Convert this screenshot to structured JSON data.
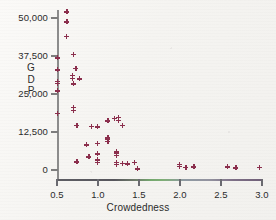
{
  "chart_data": {
    "type": "scatter",
    "title": "",
    "xlabel": "Crowdedness",
    "ylabel": "GDP",
    "ylabel_stacked": [
      "G",
      "D",
      "P"
    ],
    "xlim": [
      0.5,
      3.0
    ],
    "ylim": [
      0,
      50000
    ],
    "grid": false,
    "legend": null,
    "xticks": [
      0.5,
      1.0,
      1.5,
      2.0,
      2.5,
      3.0
    ],
    "xtick_labels": [
      "0.5",
      "1.0",
      "1.5",
      "2.0",
      "2.5",
      "3.0"
    ],
    "yticks": [
      0,
      12500,
      25000,
      37500,
      50000
    ],
    "ytick_labels": [
      "0",
      "12,500",
      "25,000",
      "37,500",
      "50,000"
    ],
    "marker": "plus",
    "marker_color": "#8b2f4d",
    "axis_color": "#8c8c8c",
    "background_color": "#f7f6f3",
    "points": [
      [
        0.62,
        52000
      ],
      [
        0.62,
        48800
      ],
      [
        0.61,
        44000
      ],
      [
        0.7,
        38000
      ],
      [
        0.5,
        36900
      ],
      [
        0.73,
        33400
      ],
      [
        0.5,
        33000
      ],
      [
        0.69,
        31200
      ],
      [
        0.69,
        30200
      ],
      [
        0.77,
        30000
      ],
      [
        0.5,
        29100
      ],
      [
        0.5,
        28600
      ],
      [
        0.7,
        28300
      ],
      [
        0.5,
        26100
      ],
      [
        0.7,
        20600
      ],
      [
        0.7,
        19700
      ],
      [
        0.5,
        18700
      ],
      [
        1.2,
        17000
      ],
      [
        1.25,
        17400
      ],
      [
        1.25,
        16400
      ],
      [
        1.12,
        16200
      ],
      [
        1.3,
        14800
      ],
      [
        0.74,
        14700
      ],
      [
        0.92,
        14300
      ],
      [
        0.99,
        14200
      ],
      [
        1.12,
        10600
      ],
      [
        1.12,
        10100
      ],
      [
        1.12,
        9400
      ],
      [
        0.99,
        8700
      ],
      [
        0.86,
        8300
      ],
      [
        1.22,
        6000
      ],
      [
        1.22,
        5400
      ],
      [
        1.22,
        4800
      ],
      [
        0.99,
        5300
      ],
      [
        0.89,
        4400
      ],
      [
        0.99,
        3400
      ],
      [
        1.22,
        2600
      ],
      [
        1.22,
        1900
      ],
      [
        0.99,
        2600
      ],
      [
        0.74,
        2700
      ],
      [
        1.3,
        2200
      ],
      [
        1.36,
        2000
      ],
      [
        1.44,
        2600
      ],
      [
        1.48,
        600
      ],
      [
        1.48,
        400
      ],
      [
        1.99,
        1900
      ],
      [
        1.99,
        1300
      ],
      [
        2.07,
        900
      ],
      [
        2.17,
        1000
      ],
      [
        2.58,
        1100
      ],
      [
        2.68,
        700
      ],
      [
        2.97,
        800
      ]
    ]
  }
}
